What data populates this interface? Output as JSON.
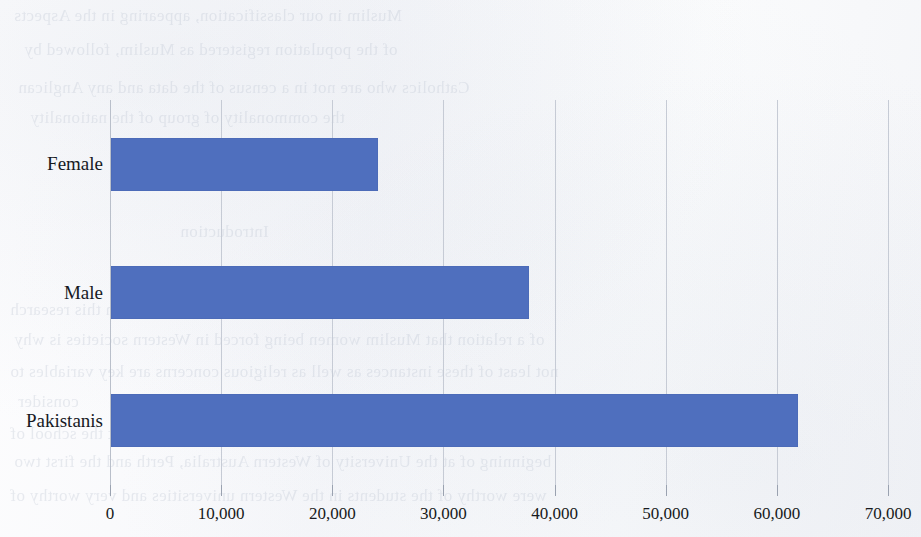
{
  "chart_data": {
    "type": "bar",
    "orientation": "horizontal",
    "title": "",
    "xlabel": "",
    "ylabel": "",
    "categories": [
      "Pakistanis",
      "Male",
      "Female"
    ],
    "values": [
      61900,
      37700,
      24100
    ],
    "series": [
      {
        "name": "Count",
        "values": [
          61900,
          37700,
          24100
        ],
        "color": "#4f6fbe"
      }
    ],
    "xlim": [
      0,
      70000
    ],
    "xticks": [
      0,
      10000,
      20000,
      30000,
      40000,
      50000,
      60000,
      70000
    ],
    "xtick_labels": [
      "0",
      "10,000",
      "20,000",
      "30,000",
      "40,000",
      "50,000",
      "60,000",
      "70,000"
    ],
    "grid": true,
    "grid_axis": "x",
    "legend": false,
    "legend_position": "none",
    "bar_color": "#4f6fbe",
    "gridline_color": "#c6cbd5",
    "background_color": "#fbfbfc",
    "text_color": "#171a20"
  },
  "page": {
    "medium": "scanned-book-page",
    "bleed_through_visible": true,
    "bleed_lines": [
      {
        "text": "Muslim in our classification, appearing in the Aspects",
        "x": 14,
        "y": 6
      },
      {
        "text": "of the population registered as Muslim, followed by",
        "x": 24,
        "y": 40
      },
      {
        "text": "Catholics who are not in a census of the data and any Anglican",
        "x": 18,
        "y": 78
      },
      {
        "text": "the commonality of group of the nationality",
        "x": 30,
        "y": 108
      },
      {
        "text": "Introduction",
        "x": 180,
        "y": 222
      },
      {
        "text": "this section the respondents in this research",
        "x": 10,
        "y": 300
      },
      {
        "text": "of a relation that Muslim women being forced in Western societies is why",
        "x": 14,
        "y": 330
      },
      {
        "text": "not least of these instances as well as religious concerns are key variables to",
        "x": 10,
        "y": 362
      },
      {
        "text": "consider",
        "x": 18,
        "y": 392
      },
      {
        "text": "throughout the research was conducted at the school of",
        "x": 10,
        "y": 424
      },
      {
        "text": "beginning of at the University of Western Australia, Perth and the first two",
        "x": 14,
        "y": 452
      },
      {
        "text": "were worthy of the students in the Western universities and very worthy of",
        "x": 10,
        "y": 486
      }
    ]
  }
}
